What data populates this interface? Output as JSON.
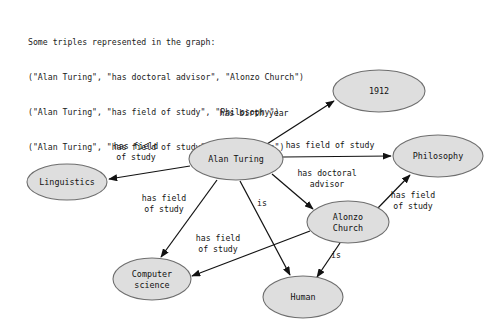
{
  "caption": {
    "lines": [
      "Some triples represented in the graph:",
      "(\"Alan Turing\", \"has doctoral advisor\", \"Alonzo Church\")",
      "(\"Alan Turing\", \"has field of study\", \"Philosophy\")",
      "(\"Alan Turing\", \"has field of study\", \"Linguistics\")"
    ]
  },
  "colors": {
    "node_fill": "#dedede",
    "node_stroke": "#6e6e6e",
    "edge_stroke": "#121212",
    "text": "#111111",
    "background": "#ffffff"
  },
  "graph": {
    "nodes": [
      {
        "id": "alan_turing",
        "label": "Alan Turing",
        "label_lines": [
          "Alan Turing"
        ],
        "cx": 236,
        "cy": 159,
        "rx": 47,
        "ry": 21
      },
      {
        "id": "year_1912",
        "label": "1912",
        "label_lines": [
          "1912"
        ],
        "cx": 379,
        "cy": 91,
        "rx": 46,
        "ry": 21
      },
      {
        "id": "philosophy",
        "label": "Philosophy",
        "label_lines": [
          "Philosophy"
        ],
        "cx": 438,
        "cy": 156,
        "rx": 45,
        "ry": 21
      },
      {
        "id": "linguistics",
        "label": "Linguistics",
        "label_lines": [
          "Linguistics"
        ],
        "cx": 67,
        "cy": 182,
        "rx": 40,
        "ry": 18
      },
      {
        "id": "alonzo_church",
        "label": "Alonzo Church",
        "label_lines": [
          "Alonzo",
          "Church"
        ],
        "cx": 348,
        "cy": 222,
        "rx": 41,
        "ry": 21
      },
      {
        "id": "computer_science",
        "label": "Computer science",
        "label_lines": [
          "Computer",
          "science"
        ],
        "cx": 152,
        "cy": 279,
        "rx": 39,
        "ry": 21
      },
      {
        "id": "human",
        "label": "Human",
        "label_lines": [
          "Human"
        ],
        "cx": 303,
        "cy": 297,
        "rx": 40,
        "ry": 21
      }
    ],
    "edges": [
      {
        "id": "e_birth_year",
        "from": "alan_turing",
        "to": "year_1912",
        "label": "has birth year",
        "label_lines": [
          "has birth year"
        ],
        "label_x": 254,
        "label_y": 113,
        "x1": 267,
        "y1": 144,
        "x2": 334,
        "y2": 101
      },
      {
        "id": "e_fos_philosophy",
        "from": "alan_turing",
        "to": "philosophy",
        "label": "has field of study",
        "label_lines": [
          "has field of study"
        ],
        "label_x": 330,
        "label_y": 145,
        "x1": 283,
        "y1": 157,
        "x2": 391,
        "y2": 156
      },
      {
        "id": "e_fos_linguistics",
        "from": "alan_turing",
        "to": "linguistics",
        "label": "has field of study",
        "label_lines": [
          "has field",
          "of study"
        ],
        "label_x": 136,
        "label_y": 151,
        "x1": 190,
        "y1": 166,
        "x2": 109,
        "y2": 179
      },
      {
        "id": "e_doctoral",
        "from": "alan_turing",
        "to": "alonzo_church",
        "label": "has doctoral advisor",
        "label_lines": [
          "has doctoral",
          "advisor"
        ],
        "label_x": 327,
        "label_y": 178,
        "x1": 272,
        "y1": 174,
        "x2": 313,
        "y2": 209
      },
      {
        "id": "e_fos_compsci_at",
        "from": "alan_turing",
        "to": "computer_science",
        "label": "has field of study",
        "label_lines": [
          "has field",
          "of study"
        ],
        "label_x": 164,
        "label_y": 203,
        "x1": 217,
        "y1": 180,
        "x2": 161,
        "y2": 257
      },
      {
        "id": "e_is_human_at",
        "from": "alan_turing",
        "to": "human",
        "label": "is",
        "label_lines": [
          "is"
        ],
        "label_x": 262,
        "label_y": 203,
        "x1": 240,
        "y1": 181,
        "x2": 290,
        "y2": 275
      },
      {
        "id": "e_fos_philosophy2",
        "from": "alonzo_church",
        "to": "philosophy",
        "label": "has field of study",
        "label_lines": [
          "has field",
          "of study"
        ],
        "label_x": 413,
        "label_y": 200,
        "x1": 377,
        "y1": 209,
        "x2": 410,
        "y2": 175
      },
      {
        "id": "e_fos_compsci_ac",
        "from": "alonzo_church",
        "to": "computer_science",
        "label": "has field of study",
        "label_lines": [
          "has field",
          "of study"
        ],
        "label_x": 218,
        "label_y": 243,
        "x1": 310,
        "y1": 231,
        "x2": 192,
        "y2": 276
      },
      {
        "id": "e_is_human_ac",
        "from": "alonzo_church",
        "to": "human",
        "label": "is",
        "label_lines": [
          "is"
        ],
        "label_x": 336,
        "label_y": 255,
        "x1": 340,
        "y1": 243,
        "x2": 317,
        "y2": 277
      }
    ]
  }
}
